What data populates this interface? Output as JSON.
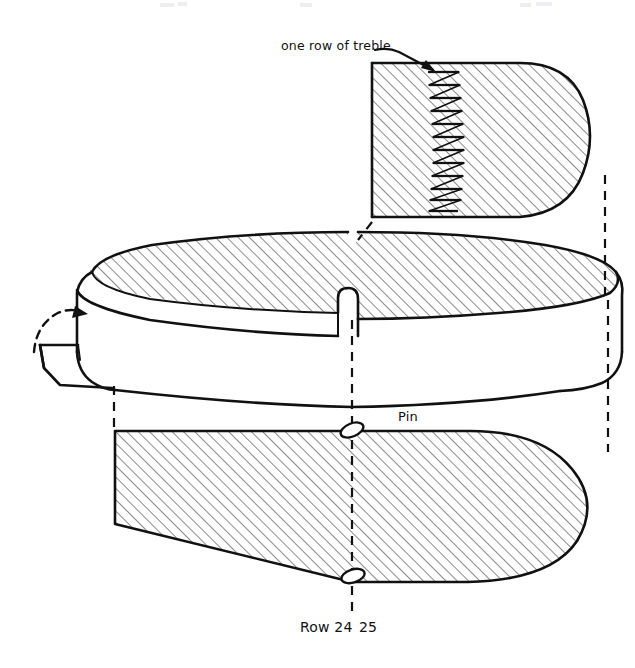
{
  "document": {
    "kind": "hand-drawn-crochet-pattern-diagram",
    "title_visible": false,
    "background_color": "#ffffff",
    "ink_color": "#111111"
  },
  "annotations": {
    "treble_label": "one row of treble",
    "pin_label": "Pin",
    "row_label": "Row 24",
    "row_label_second": "25",
    "row_label_full": "Row 24 25"
  },
  "shapes": {
    "top_panel": {
      "name": "top-flap-panel",
      "description": "hatched rounded panel at top with a vertical column of treble stitch bars",
      "treble_bar_count": 12,
      "hatched": true
    },
    "middle_body": {
      "name": "three-dimensional-slipper-body",
      "description": "perspective drawing of slipper/hat body, hatched top surface, plain side wall, notch at centre",
      "hatched_top": true
    },
    "left_tab": {
      "name": "left-folded-tab",
      "description": "small quadrilateral flap at left being folded up, indicated by curved dashed arrow"
    },
    "bottom_panel": {
      "name": "bottom-sole-panel",
      "description": "large hatched sole outline, flat left edge, rounded right tip",
      "hatched": true,
      "pin_marker_count": 2
    }
  },
  "guides": {
    "left_dashed_line": "alignment guide from body to sole left edge",
    "centre_dashed_line": "alignment guide marking row 24 / 25 boundary",
    "right_dashed_line": "alignment guide from top panel down to body right edge"
  }
}
